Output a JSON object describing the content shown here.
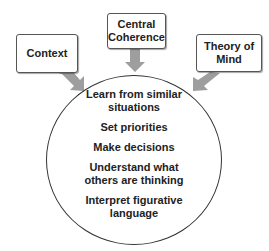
{
  "diagram": {
    "inputs": [
      {
        "id": "context",
        "label_lines": [
          "Context"
        ]
      },
      {
        "id": "central-coherence",
        "label_lines": [
          "Central",
          "Coherence"
        ]
      },
      {
        "id": "theory-of-mind",
        "label_lines": [
          "Theory of",
          "Mind"
        ]
      }
    ],
    "outcomes": [
      {
        "lines": [
          "Learn from similar",
          "situations"
        ]
      },
      {
        "lines": [
          "Set priorities"
        ]
      },
      {
        "lines": [
          "Make decisions"
        ]
      },
      {
        "lines": [
          "Understand what",
          "others are thinking"
        ]
      },
      {
        "lines": [
          "Interpret figurative",
          "language"
        ]
      }
    ],
    "colors": {
      "arrow": "#9e9e9e",
      "box_border": "#555555",
      "circle_border": "#333333",
      "text": "#222222"
    }
  }
}
